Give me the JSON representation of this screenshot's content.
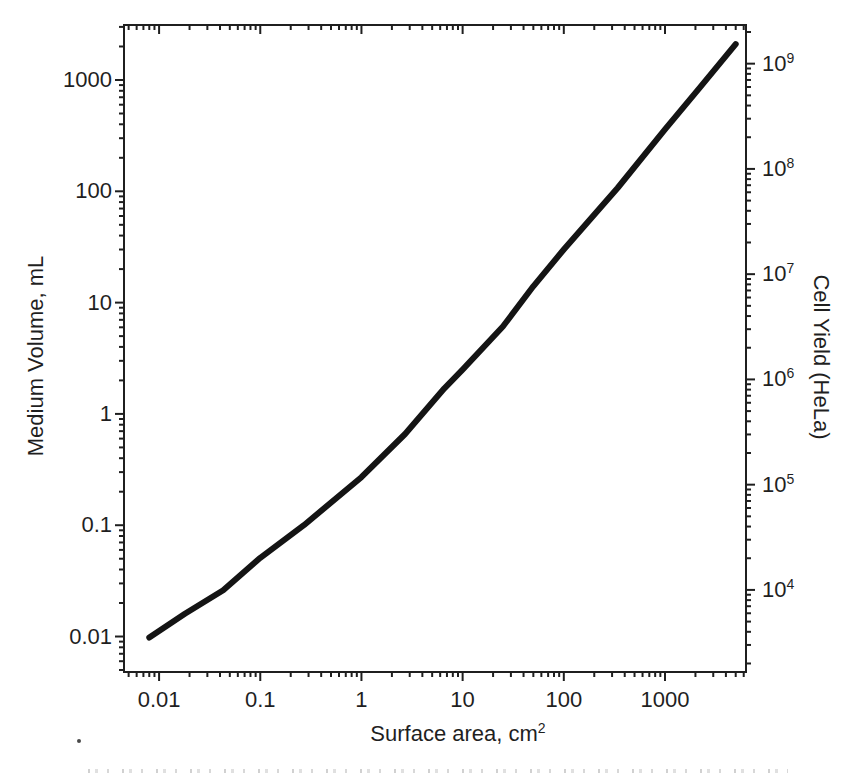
{
  "figure": {
    "background": "#ffffff",
    "ink_color": "#1f1f1f",
    "curve_color": "#141414",
    "stray_mark": "."
  },
  "chart_data": {
    "type": "line",
    "scale": "log-log",
    "grid": false,
    "legend": null,
    "title": "",
    "xlabel": {
      "text": "Surface area, cm",
      "sup": "2"
    },
    "ylabel_left": "Medium Volume, mL",
    "ylabel_right": "Cell Yield (HeLa)",
    "x_axis": {
      "range": [
        0.0045,
        6320
      ],
      "tick_values": [
        0.01,
        0.1,
        1,
        10,
        100,
        1000
      ],
      "tick_labels": [
        "0.01",
        "0.1",
        "1",
        "10",
        "100",
        "1000"
      ]
    },
    "y_axis_left": {
      "range": [
        0.0048,
        3120
      ],
      "tick_values": [
        0.01,
        0.1,
        1,
        10,
        100,
        1000
      ],
      "tick_labels": [
        "0.01",
        "0.1",
        "1",
        "10",
        "100",
        "1000"
      ]
    },
    "y_axis_right": {
      "range": [
        1660,
        2330000000
      ],
      "tick_base": "10",
      "tick_values": [
        10000,
        100000,
        1000000,
        10000000,
        100000000,
        1000000000
      ],
      "tick_exponents": [
        "4",
        "5",
        "6",
        "7",
        "8",
        "9"
      ]
    },
    "series": [
      {
        "name": "Medium volume vs surface area",
        "x": [
          0.008,
          0.018,
          0.043,
          0.1,
          0.27,
          1,
          2.7,
          6.6,
          10,
          25,
          50,
          100,
          340,
          1000,
          2200,
          5000
        ],
        "y": [
          0.0098,
          0.016,
          0.026,
          0.051,
          0.1,
          0.27,
          0.66,
          1.7,
          2.5,
          6.1,
          14,
          30,
          107,
          360,
          850,
          2100
        ]
      }
    ]
  }
}
